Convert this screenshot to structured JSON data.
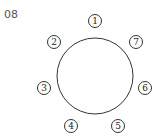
{
  "problem_number": "08",
  "table": {
    "shape": "circle"
  },
  "seats": [
    {
      "label": "1",
      "x": 95,
      "y": 21
    },
    {
      "label": "2",
      "x": 54,
      "y": 42
    },
    {
      "label": "3",
      "x": 44,
      "y": 88
    },
    {
      "label": "4",
      "x": 71,
      "y": 126
    },
    {
      "label": "5",
      "x": 118,
      "y": 126
    },
    {
      "label": "6",
      "x": 145,
      "y": 88
    },
    {
      "label": "7",
      "x": 136,
      "y": 42
    }
  ]
}
